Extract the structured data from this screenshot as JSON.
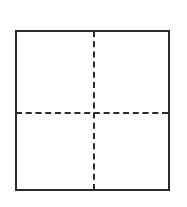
{
  "figure": {
    "type": "line-drawing",
    "background_color": "#ffffff",
    "stroke_color": "#2b2b2b",
    "canvas": {
      "width": 187,
      "height": 207
    },
    "shapes": {
      "square": {
        "name": "outer square",
        "style": "solid",
        "stroke_width": 2,
        "x": 15,
        "y": 30,
        "width": 155,
        "height": 161
      },
      "vertical_divider": {
        "name": "vertical dashed divider",
        "style": "dashed",
        "stroke_width": 2,
        "x": 94,
        "y_start": 31,
        "y_end": 190
      },
      "horizontal_divider": {
        "name": "horizontal dashed divider",
        "style": "dashed",
        "stroke_width": 2,
        "y": 113,
        "x_start": 16,
        "x_end": 168
      }
    },
    "labels": {
      "caption": "",
      "annotations": []
    }
  }
}
